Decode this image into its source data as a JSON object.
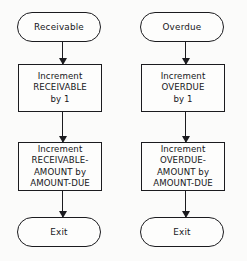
{
  "diagram": {
    "type": "flowchart",
    "colors": {
      "stroke": "#1b1b1f",
      "background": "#fbfbfa",
      "text": "#16161a"
    },
    "columns": [
      {
        "id": "receivable",
        "start": {
          "label": "Receivable"
        },
        "box1": {
          "lines": [
            "Increment",
            "RECEIVABLE",
            "by 1"
          ]
        },
        "box2": {
          "lines": [
            "Increment",
            "RECEIVABLE-",
            "AMOUNT by",
            "AMOUNT-DUE"
          ]
        },
        "exit": {
          "label": "Exit"
        }
      },
      {
        "id": "overdue",
        "start": {
          "label": "Overdue"
        },
        "box1": {
          "lines": [
            "Increment",
            "OVERDUE",
            "by 1"
          ]
        },
        "box2": {
          "lines": [
            "Increment",
            "OVERDUE-",
            "AMOUNT by",
            "AMOUNT-DUE"
          ]
        },
        "exit": {
          "label": "Exit"
        }
      }
    ],
    "connectors": [
      {
        "id": "receivable-start-to-box1",
        "direction": "down"
      },
      {
        "id": "receivable-box1-to-box2",
        "direction": "down"
      },
      {
        "id": "receivable-box2-to-exit",
        "direction": "down"
      },
      {
        "id": "overdue-start-to-box1",
        "direction": "down"
      },
      {
        "id": "overdue-box1-to-box2",
        "direction": "down"
      },
      {
        "id": "overdue-box2-to-exit",
        "direction": "down"
      }
    ]
  }
}
